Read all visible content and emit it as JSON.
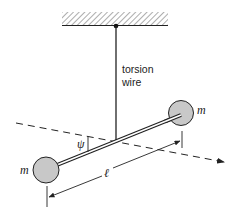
{
  "diagram": {
    "labels": {
      "wire_line1": "torsion",
      "wire_line2": "wire",
      "mass_right": "m",
      "mass_left": "m",
      "angle": "ψ",
      "length": "ℓ"
    },
    "colors": {
      "line": "#222222",
      "mass_fill": "#c8c8c8",
      "hatch": "#888888",
      "background": "#ffffff"
    },
    "components": [
      "ceiling-support",
      "torsion-wire",
      "rod",
      "mass-left",
      "mass-right",
      "rotation-axis",
      "angle-psi",
      "length-dimension"
    ]
  }
}
